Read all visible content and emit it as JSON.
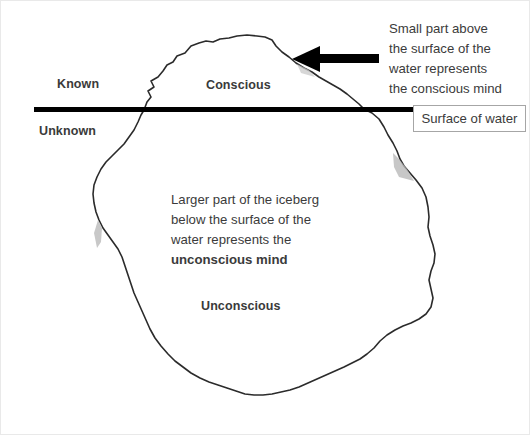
{
  "diagram": {
    "colors": {
      "waterline": "#000000",
      "arrow": "#000000",
      "iceberg_outline": "#2b2b2b",
      "iceberg_fill": "#ffffff",
      "shading": "#b3b3b3",
      "text": "#3b3b3b",
      "box_border": "#a6a6a6",
      "canvas_border": "#e9e9e9",
      "background": "#ffffff"
    },
    "labels": {
      "known": "Known",
      "unknown": "Unknown",
      "conscious": "Conscious",
      "unconscious": "Unconscious"
    },
    "annotations": {
      "conscious_note": {
        "lines": [
          "Small part above",
          "the surface of the",
          "water represents",
          "the conscious mind"
        ]
      },
      "unconscious_note": {
        "lines": [
          "Larger part of the iceberg",
          "below the surface of the",
          "water represents the"
        ],
        "bold_line": "unconscious mind"
      }
    },
    "surface_box": {
      "label": "Surface of water"
    },
    "arrow": {
      "direction": "left",
      "points_to": "iceberg-tip"
    }
  }
}
